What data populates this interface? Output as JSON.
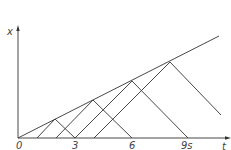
{
  "diagram": {
    "title": "",
    "axes": {
      "y_label": "x",
      "x_label": "t",
      "x_ticks": [
        "0",
        "3",
        "6",
        "9s"
      ]
    },
    "colors": {
      "line": "#333333",
      "text": "#444444",
      "background": "#ffffff"
    }
  }
}
